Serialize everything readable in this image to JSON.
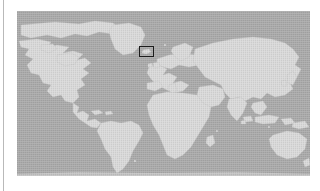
{
  "page": {
    "background_color": "#ffffff",
    "width": 320,
    "height": 191,
    "left_rule_color": "#b9b9b9"
  },
  "figure": {
    "name": "world-map-locator",
    "type": "locator-map",
    "projection": "equirectangular",
    "bounds_px": {
      "x": 17,
      "y": 11,
      "width": 293,
      "height": 165
    },
    "colors": {
      "ocean": "#a9a9a9",
      "land": "#d9d9d9",
      "coastline": "#c4c4c4",
      "highlight_outline": "#1c1c1c"
    },
    "caption": ""
  },
  "highlight": {
    "name": "region-of-interest",
    "label": "",
    "shape": "rectangle",
    "bounds_px": {
      "x": 139,
      "y": 46,
      "width": 15,
      "height": 11
    },
    "outline_color": "#1c1c1c",
    "outline_width_px": 1.5,
    "fill": "none",
    "approx_location": "North Atlantic / Iceland"
  },
  "landmasses": [
    {
      "name": "north-america"
    },
    {
      "name": "greenland"
    },
    {
      "name": "south-america"
    },
    {
      "name": "europe"
    },
    {
      "name": "africa"
    },
    {
      "name": "asia"
    },
    {
      "name": "australia"
    },
    {
      "name": "antarctica-edge"
    }
  ]
}
